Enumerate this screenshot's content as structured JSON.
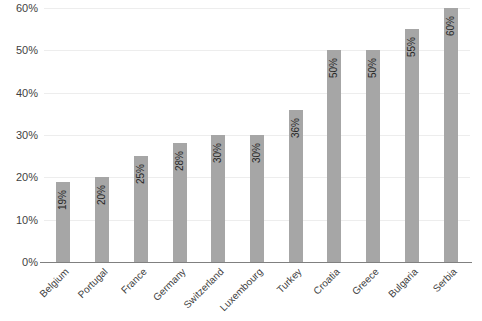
{
  "chart_data": {
    "type": "bar",
    "title": "",
    "subtitle": "",
    "xlabel": "",
    "ylabel": "",
    "ylim": [
      0,
      60
    ],
    "grid": true,
    "legend": false,
    "legend_position": "none",
    "bar_color": "#a6a6a6",
    "gridline_color": "#ededed",
    "axis_color": "#808080",
    "label_color": "#3f3f3f",
    "value_label_color": "#262626",
    "value_label_rotation": -90,
    "category_label_rotation": -45,
    "categories": [
      "Belgium",
      "Portugal",
      "France",
      "Germany",
      "Switzerland",
      "Luxembourg",
      "Turkey",
      "Croatia",
      "Greece",
      "Bulgaria",
      "Serbia"
    ],
    "values": [
      19,
      20,
      25,
      28,
      30,
      30,
      36,
      50,
      50,
      55,
      60
    ],
    "value_labels": [
      "19%",
      "20%",
      "25%",
      "28%",
      "30%",
      "30%",
      "36%",
      "50%",
      "50%",
      "55%",
      "60%"
    ],
    "y_ticks": [
      0,
      10,
      20,
      30,
      40,
      50,
      60
    ],
    "y_tick_labels": [
      "0%",
      "10%",
      "20%",
      "30%",
      "40%",
      "50%",
      "60%"
    ]
  }
}
